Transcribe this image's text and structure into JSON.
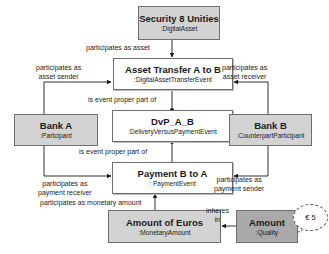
{
  "nodes": {
    "security": {
      "title": "Security 8 Unities",
      "type": ":DigitalAsset"
    },
    "asset_transfer": {
      "title": "Asset Transfer A to B",
      "type": ":DigitalAssetTransferEvent"
    },
    "dvp": {
      "title": "DvP_A_B",
      "type": ":DeliveryVersusPaymentEvent"
    },
    "bank_a": {
      "title": "Bank A",
      "type": ":Partcipant"
    },
    "bank_b": {
      "title": "Bank B",
      "type": ":CounterpartParticipant"
    },
    "payment": {
      "title": "Payment B to A",
      "type": ": PaymentEvent"
    },
    "amount_euros": {
      "title": "Amount of Euros",
      "type": ":MonetaryAmount"
    },
    "amount_quality": {
      "title": "Amount",
      "type": ":Quality"
    },
    "value": {
      "label": "€ 5"
    }
  },
  "edges": {
    "participates_asset": "participates as asset",
    "asset_sender_1": "participates as",
    "asset_sender_2": "asset sender",
    "asset_receiver_1": "participates as",
    "asset_receiver_2": "asset receiver",
    "proper_part_1": "is event proper part of",
    "proper_part_2": "is event proper part of",
    "payment_receiver_1": "participates as",
    "payment_receiver_2": "payment receiver",
    "payment_sender_1": "participates as",
    "payment_sender_2": "payment sender",
    "monetary_amount": "participates as monetary amount",
    "inheres_1": "inheres",
    "inheres_2": "in"
  },
  "colors": {
    "white_box": "#ffffff",
    "light_box": "#d3d3d3",
    "dark_box": "#a9a9a9",
    "line": "#1a1a1a"
  }
}
